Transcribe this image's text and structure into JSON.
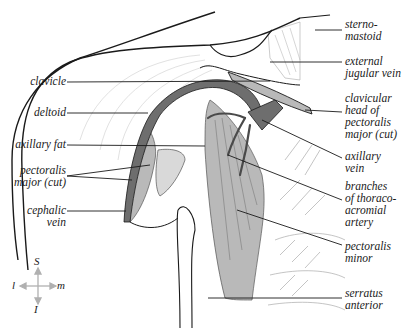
{
  "figure": {
    "type": "anatomical-diagram",
    "colors": {
      "outline": "#1a1a1a",
      "muscle_fill": "#b9b9b9",
      "vessel_fill": "#6e6e6e",
      "light_fill": "#d9d9d9",
      "hatch": "#9a9a9a",
      "orientation_arrows": "#b0b0b0"
    }
  },
  "labels_left": [
    {
      "id": "clavicle",
      "text": "clavicle"
    },
    {
      "id": "deltoid",
      "text": "deltoid"
    },
    {
      "id": "axillary-fat",
      "text": "axillary fat"
    },
    {
      "id": "pectoralis-major-cut-left",
      "text": "pectoralis\nmajor (cut)"
    },
    {
      "id": "cephalic-vein",
      "text": "cephalic\nvein"
    }
  ],
  "labels_right": [
    {
      "id": "sternomastoid",
      "text": "sterno-\nmastoid"
    },
    {
      "id": "external-jugular-vein",
      "text": "external\njugular vein"
    },
    {
      "id": "clavicular-head-pectoralis-major",
      "text": "clavicular\nhead of\npectoralis\nmajor (cut)"
    },
    {
      "id": "axillary-vein",
      "text": "axillary\nvein"
    },
    {
      "id": "branches-thoracoacromial-artery",
      "text": "branches\nof thoraco-\nacromial\nartery"
    },
    {
      "id": "pectoralis-minor",
      "text": "pectoralis\nminor"
    },
    {
      "id": "serratus-anterior",
      "text": "serratus\nanterior"
    }
  ],
  "orientation": {
    "superior": "S",
    "inferior": "I",
    "lateral": "l",
    "medial": "m"
  }
}
